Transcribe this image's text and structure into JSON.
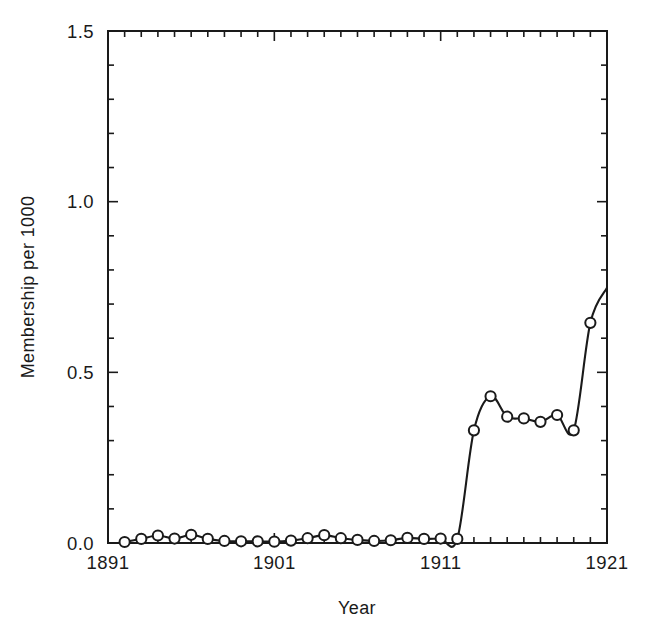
{
  "chart_data": {
    "type": "line",
    "title": "",
    "xlabel": "Year",
    "ylabel": "Membership per 1000",
    "xlim": [
      1891,
      1921
    ],
    "ylim": [
      0.0,
      1.5
    ],
    "grid": false,
    "legend": "none",
    "marker": "open-circle",
    "line_style": "smooth-spline",
    "x_tick_labels": [
      "1891",
      "1901",
      "1911",
      "1921"
    ],
    "x_tick_label_values": [
      1891,
      1901,
      1911,
      1921
    ],
    "x_minor_tick_interval": 1,
    "y_tick_labels": [
      "0.0",
      "0.5",
      "1.0",
      "1.5"
    ],
    "y_tick_label_values": [
      0.0,
      0.5,
      1.0,
      1.5
    ],
    "y_minor_tick_interval": 0.1,
    "series": [
      {
        "name": "Membership per 1000",
        "x": [
          1892,
          1893,
          1894,
          1895,
          1896,
          1897,
          1898,
          1899,
          1900,
          1901,
          1902,
          1903,
          1904,
          1905,
          1906,
          1907,
          1908,
          1909,
          1910,
          1911,
          1912,
          1913,
          1914,
          1915,
          1916,
          1917,
          1918,
          1919,
          1920
        ],
        "values": [
          0.003,
          0.012,
          0.022,
          0.013,
          0.024,
          0.012,
          0.006,
          0.005,
          0.005,
          0.004,
          0.007,
          0.014,
          0.023,
          0.014,
          0.009,
          0.006,
          0.008,
          0.015,
          0.012,
          0.013,
          0.012,
          0.33,
          0.43,
          0.37,
          0.365,
          0.355,
          0.375,
          0.33,
          0.645
        ],
        "end_point": {
          "x": 1921,
          "value": 0.748
        }
      }
    ]
  },
  "axes": {
    "y_axis_title": "Membership per 1000",
    "x_axis_title": "Year"
  },
  "colors": {
    "line": "#1a1a1a",
    "marker_stroke": "#1a1a1a",
    "marker_fill": "#ffffff",
    "axis": "#1a1a1a",
    "background": "#ffffff"
  }
}
